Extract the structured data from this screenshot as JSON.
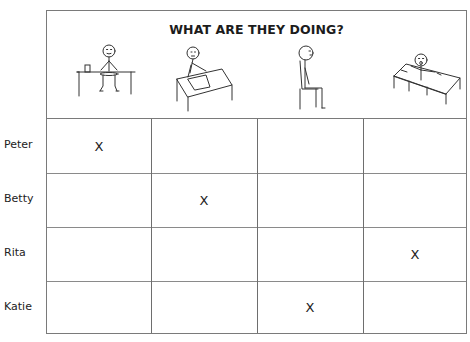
{
  "worksheet": {
    "title": "WHAT ARE THEY DOING?",
    "activities": [
      {
        "icon": "eating-at-table-icon",
        "description": "person sitting at a table with a plate and cup"
      },
      {
        "icon": "writing-at-desk-icon",
        "description": "person writing on paper at a desk"
      },
      {
        "icon": "sitting-on-chair-icon",
        "description": "person sitting on a chair"
      },
      {
        "icon": "waking-up-in-bed-icon",
        "description": "person in bed yawning"
      }
    ],
    "rows": [
      {
        "name": "Peter",
        "marks": [
          "X",
          "",
          "",
          ""
        ]
      },
      {
        "name": "Betty",
        "marks": [
          "",
          "X",
          "",
          ""
        ]
      },
      {
        "name": "Rita",
        "marks": [
          "",
          "",
          "",
          "X"
        ]
      },
      {
        "name": "Katie",
        "marks": [
          "",
          "",
          "X",
          ""
        ]
      }
    ]
  }
}
